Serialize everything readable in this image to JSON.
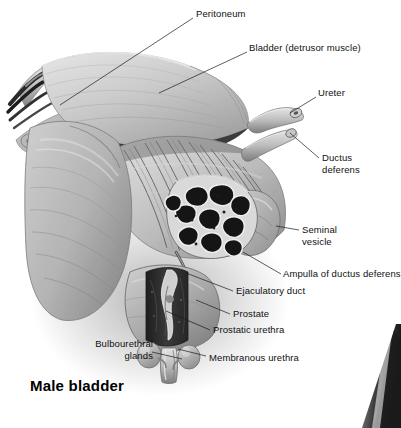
{
  "figure": {
    "title": "Male bladder",
    "orientation": "anterior-oblique cut-away view",
    "palette": {
      "background": "#ffffff",
      "tissue_light": "#d8d8d8",
      "tissue_mid": "#a8a8a8",
      "tissue_dark": "#6e6e6e",
      "cut_surface": "#2e2e2e",
      "lumen_black": "#141414",
      "leader_line": "#1a1a1a",
      "label_text": "#101010"
    },
    "labels": [
      {
        "id": "peritoneum",
        "text": "Peritoneum",
        "align": "left",
        "x": 196,
        "y": 8,
        "leader": [
          [
            193,
            18
          ],
          [
            60,
            105
          ]
        ]
      },
      {
        "id": "bladder-detrusor-muscle",
        "text": "Bladder (detrusor muscle)",
        "align": "left",
        "x": 249,
        "y": 42,
        "leader": [
          [
            247,
            52
          ],
          [
            159,
            93
          ]
        ]
      },
      {
        "id": "ureter",
        "text": "Ureter",
        "align": "left",
        "x": 318,
        "y": 87,
        "leader": [
          [
            316,
            97
          ],
          [
            290,
            113
          ]
        ]
      },
      {
        "id": "ductus-deferens",
        "text": "Ductus\ndeferens",
        "align": "left",
        "x": 322,
        "y": 152,
        "leader": [
          [
            319,
            158
          ],
          [
            290,
            133
          ]
        ]
      },
      {
        "id": "seminal-vesicle",
        "text": "Seminal\nvesicle",
        "align": "left",
        "x": 302,
        "y": 224,
        "leader": [
          [
            299,
            230
          ],
          [
            276,
            226
          ]
        ]
      },
      {
        "id": "ampulla-of-ductus-deferens",
        "text": "Ampulla of ductus deferens",
        "align": "left",
        "x": 283,
        "y": 268,
        "leader": [
          [
            281,
            274
          ],
          [
            243,
            252
          ]
        ]
      },
      {
        "id": "ejaculatory-duct",
        "text": "Ejaculatory duct",
        "align": "left",
        "x": 236,
        "y": 285,
        "leader": [
          [
            233,
            291
          ],
          [
            186,
            273
          ]
        ]
      },
      {
        "id": "prostate",
        "text": "Prostate",
        "align": "left",
        "x": 233,
        "y": 308,
        "leader": [
          [
            230,
            314
          ],
          [
            196,
            300
          ]
        ]
      },
      {
        "id": "prostatic-urethra",
        "text": "Prostatic urethra",
        "align": "left",
        "x": 213,
        "y": 324,
        "leader": [
          [
            210,
            330
          ],
          [
            166,
            311
          ]
        ]
      },
      {
        "id": "membranous-urethra",
        "text": "Membranous urethra",
        "align": "left",
        "x": 209,
        "y": 352,
        "leader": [
          [
            206,
            356
          ],
          [
            178,
            349
          ]
        ]
      },
      {
        "id": "bulbourethral-glands",
        "text": "Bulbourethral\nglands",
        "align": "right",
        "x": 71,
        "y": 338,
        "leader": [
          [
            152,
            352
          ],
          [
            182,
            359
          ]
        ]
      }
    ],
    "structures": [
      "peritoneum flap",
      "bladder detrusor muscle striations",
      "severed vessel bundle (upper left)",
      "ureter",
      "ductus deferens",
      "ampulla of ductus deferens",
      "seminal vesicle cross-section",
      "ejaculatory duct",
      "prostate with cut window",
      "prostatic urethra",
      "membranous urethra",
      "bulbourethral glands (paired)",
      "adjacent figure edge (lower right)"
    ]
  }
}
